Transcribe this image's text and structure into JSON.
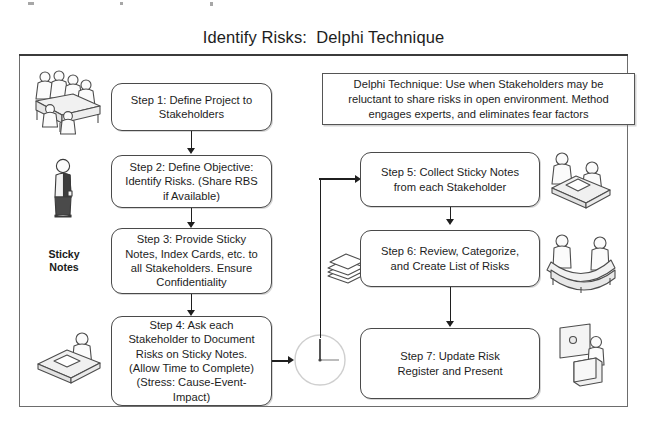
{
  "diagram": {
    "title": "Identify Risks:  Delphi Technique",
    "caption": "Sticky\nNotes",
    "note": {
      "label": "delphi-technique-note",
      "text": "Delphi Technique:  Use when Stakeholders may be\nreluctant to share risks in open environment.  Method\nengages experts, and eliminates fear factors"
    },
    "steps": [
      {
        "id": "step-1",
        "text": "Step 1: Define Project to\nStakeholders"
      },
      {
        "id": "step-2",
        "text": "Step 2: Define Objective:\nIdentify Risks.  (Share RBS\nif Available)"
      },
      {
        "id": "step-3",
        "text": "Step 3: Provide Sticky\nNotes, Index Cards, etc. to\nall Stakeholders.  Ensure\nConfidentiality"
      },
      {
        "id": "step-4",
        "text": "Step 4: Ask each\nStakeholder to Document\nRisks on Sticky Notes.\n(Allow Time to Complete)\n(Stress: Cause-Event-\nImpact)"
      },
      {
        "id": "step-5",
        "text": "Step 5: Collect Sticky Notes\nfrom each Stakeholder"
      },
      {
        "id": "step-6",
        "text": "Step 6: Review, Categorize,\nand Create List of Risks"
      },
      {
        "id": "step-7",
        "text": "Step 7: Update Risk\nRegister and Present"
      }
    ],
    "icons": [
      {
        "id": "meeting-table-group-icon",
        "description": "group of people seated around a table"
      },
      {
        "id": "standing-person-icon",
        "description": "single standing person"
      },
      {
        "id": "person-writing-desk-icon",
        "description": "person writing at a desk"
      },
      {
        "id": "sticky-notes-stack-icon",
        "description": "stack of sticky notes"
      },
      {
        "id": "clock-icon",
        "description": "clock face indicating elapsed time"
      },
      {
        "id": "two-people-desk-icon",
        "description": "two people collaborating at a desk"
      },
      {
        "id": "two-people-curved-table-icon",
        "description": "two people at a curved table"
      },
      {
        "id": "presenter-board-icon",
        "description": "person presenting at a board"
      }
    ],
    "colors": {
      "frame": "#6d6d6d",
      "box_border": "#4a4a4a",
      "connector": "#1f1f1f",
      "text": "#1d1d1d",
      "background": "#ffffff"
    }
  }
}
